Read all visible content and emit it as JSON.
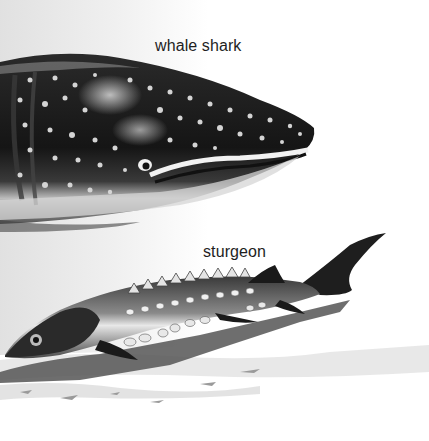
{
  "illustration": {
    "subjects": [
      {
        "id": "whale-shark",
        "label": "whale shark"
      },
      {
        "id": "sturgeon",
        "label": "sturgeon"
      }
    ],
    "palette": {
      "background": "#ffffff",
      "shark_body": "#1a1a1a",
      "shark_spots": "#d9d9d9",
      "shark_belly": "#cfcfcf",
      "sturgeon_body": "#2b2b2b",
      "scutes": "#e6e6e6",
      "shadow": "#5a5a5a",
      "seabed": "#d8d8d8",
      "label_text": "#1e1e1e"
    }
  }
}
